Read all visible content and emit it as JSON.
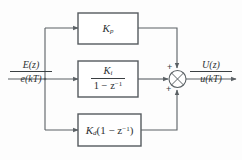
{
  "diagram": {
    "background_color": "#fdfdfd",
    "line_color": "#5a6064",
    "box_border_color": "#555a5e",
    "text_color": "#2e3234",
    "input": {
      "name": "input-signal",
      "z_domain": "E(z)",
      "time_domain": "e(kT)"
    },
    "output": {
      "name": "output-signal",
      "z_domain": "U(z)",
      "time_domain": "u(kT)"
    },
    "blocks": [
      {
        "id": "proportional",
        "label_plain": "Kp",
        "gain_symbol": "K",
        "gain_subscript": "p",
        "kind": "gain"
      },
      {
        "id": "integral",
        "label_plain": "Ki / (1 - z^-1)",
        "numerator_symbol": "K",
        "numerator_subscript": "i",
        "denominator": "1 − z",
        "denominator_exponent": "−1",
        "kind": "fraction"
      },
      {
        "id": "derivative",
        "label_plain": "Kd(1 - z^-1)",
        "gain_symbol": "K",
        "gain_subscript": "d",
        "expression_open": "(1 − z",
        "expression_exponent": "−1",
        "expression_close": ")",
        "kind": "product"
      }
    ],
    "summing_junction": {
      "id": "summer",
      "style": "circle-with-x",
      "signs": [
        "+",
        "+",
        "+"
      ],
      "sign_top": "+",
      "sign_left": "+",
      "sign_bottom": "+"
    }
  }
}
